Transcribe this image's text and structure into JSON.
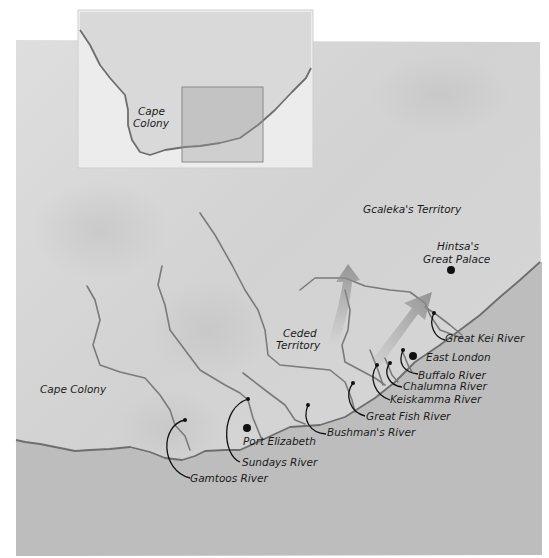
{
  "inset_map": {
    "label": "Cape Colony",
    "label_line1": "Cape",
    "label_line2": "Colony",
    "highlight_box": "region-of-main-map"
  },
  "main_map": {
    "regions": {
      "gcaleka": "Gcaleka's Territory",
      "ceded_line1": "Ceded",
      "ceded_line2": "Territory",
      "cape_colony": "Cape Colony"
    },
    "places": {
      "hintsa_line1": "Hintsa's",
      "hintsa_line2": "Great Palace",
      "east_london": "East London",
      "port_elizabeth": "Port Elizabeth"
    },
    "rivers": [
      "Great Kei River",
      "Buffalo River",
      "Chalumna River",
      "Keiskamma River",
      "Great Fish River",
      "Bushman's River",
      "Sundays River",
      "Gamtoos River"
    ],
    "arrows": [
      "arrow-north",
      "arrow-northeast"
    ]
  },
  "colors": {
    "land": "#d9d9d9",
    "sea": "#b9b9b9",
    "inset_paper": "#ececec",
    "river": "#7a7a7a",
    "arrow": "#8c8c8c",
    "ink": "#111111"
  }
}
